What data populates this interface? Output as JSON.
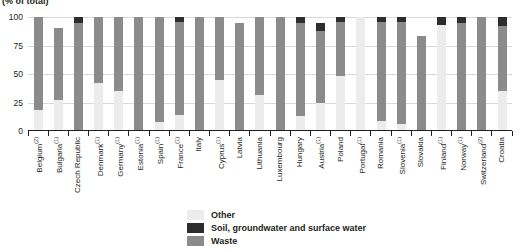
{
  "chart_data": {
    "type": "bar",
    "subtype": "stacked-bar-100",
    "title": "",
    "units_caption": "(% of total)",
    "xlabel": "",
    "ylabel": "",
    "ylim": [
      0,
      100
    ],
    "yticks": [
      0,
      25,
      50,
      75,
      100
    ],
    "grid": true,
    "legend_position": "bottom",
    "stack_order_bottom_to_top": [
      "Other",
      "Waste",
      "Soil, groundwater and surface water"
    ],
    "series": [
      {
        "name": "Other",
        "color": "#ececec",
        "values": [
          18,
          27,
          0,
          42,
          35,
          0,
          8,
          14,
          0,
          45,
          0,
          32,
          0,
          13,
          25,
          48,
          100,
          9,
          6,
          0,
          93,
          0,
          0,
          35
        ]
      },
      {
        "name": "Waste",
        "color": "#8b8b8b",
        "values": [
          82,
          63,
          95,
          58,
          65,
          100,
          92,
          82,
          100,
          55,
          95,
          68,
          100,
          82,
          63,
          48,
          0,
          87,
          90,
          83,
          0,
          95,
          100,
          57
        ]
      },
      {
        "name": "Soil, groundwater and surface water",
        "color": "#2e2d2c",
        "values": [
          0,
          0,
          5,
          0,
          0,
          0,
          0,
          4,
          0,
          0,
          0,
          0,
          0,
          5,
          7,
          4,
          0,
          4,
          4,
          0,
          7,
          5,
          0,
          8
        ]
      }
    ],
    "categories": [
      "Belgium",
      "Bulgaria",
      "Czech Republic",
      "Denmark",
      "Germany",
      "Estonia",
      "Spain",
      "France",
      "Italy",
      "Cyprus",
      "Latvia",
      "Lithuania",
      "Luxembourg",
      "Hungary",
      "Austria",
      "Poland",
      "Portugal",
      "Romania",
      "Slovenia",
      "Slovakia",
      "Finland",
      "Norway",
      "Switzerland",
      "Croatia"
    ],
    "category_footnotes": [
      "2",
      "1",
      "",
      "1",
      "1",
      "1",
      "1",
      "1",
      "",
      "1",
      "",
      "",
      "",
      "",
      "1",
      "",
      "1",
      "",
      "1",
      "",
      "1",
      "1",
      "2",
      ""
    ]
  },
  "axis": {
    "y_tick_labels": [
      "100",
      "75",
      "50",
      "25",
      "0"
    ]
  },
  "legend": {
    "items": [
      {
        "label": "Other",
        "swatch": "other-swatch"
      },
      {
        "label": "Soil, groundwater and surface water",
        "swatch": "soil-swatch"
      },
      {
        "label": "Waste",
        "swatch": "waste-swatch"
      }
    ]
  },
  "colors": {
    "other": "#ececec",
    "waste": "#8b8b8b",
    "soil": "#2e2d2c",
    "axis": "#231f20",
    "grid": "#d9d9d9"
  }
}
